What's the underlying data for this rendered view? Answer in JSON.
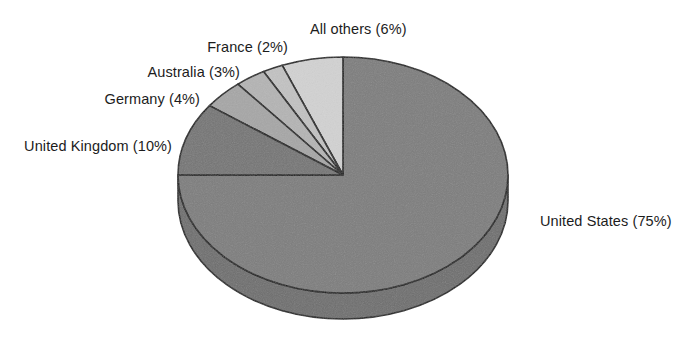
{
  "chart_data": {
    "type": "pie",
    "title": "",
    "subtitle": "",
    "xlabel": "",
    "ylabel": "",
    "legend_position": "none",
    "grid": false,
    "three_d": true,
    "start_angle_deg": 90,
    "direction": "clockwise",
    "unit": "%",
    "categories": [
      "United States",
      "All others",
      "France",
      "Australia",
      "Germany",
      "United Kingdom"
    ],
    "values": [
      75,
      6,
      2,
      3,
      4,
      10
    ],
    "slices": [
      {
        "name": "United States",
        "label": "United States (75%)",
        "value": 75,
        "color": "#7d7d7d",
        "side_color": "#6e6e6e"
      },
      {
        "name": "All others",
        "label": "All others (6%)",
        "value": 6,
        "color": "#d2d2d2",
        "side_color": "#bcbcbc"
      },
      {
        "name": "France",
        "label": "France (2%)",
        "value": 2,
        "color": "#c2c2c2",
        "side_color": "#acacac"
      },
      {
        "name": "Australia",
        "label": "Australia (3%)",
        "value": 3,
        "color": "#b4b4b4",
        "side_color": "#9e9e9e"
      },
      {
        "name": "Germany",
        "label": "Germany (4%)",
        "value": 4,
        "color": "#a6a6a6",
        "side_color": "#909090"
      },
      {
        "name": "United Kingdom",
        "label": "United Kingdom (10%)",
        "value": 10,
        "color": "#757575",
        "side_color": "#666666"
      }
    ]
  },
  "labels": {
    "all_others": "All others (6%)",
    "france": "France (2%)",
    "australia": "Australia (3%)",
    "germany": "Germany (4%)",
    "united_kingdom": "United Kingdom (10%)",
    "united_states": "United States (75%)"
  },
  "style": {
    "background": "#ffffff",
    "outline": "#1a1a1a",
    "text": "#1c1c1c"
  }
}
